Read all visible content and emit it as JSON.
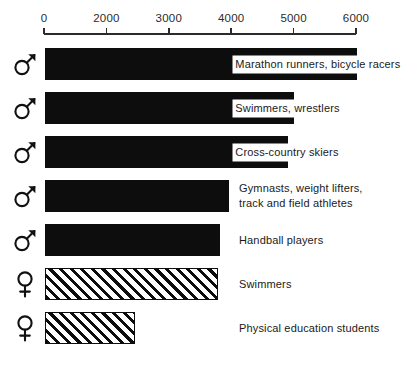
{
  "chart_data": {
    "type": "bar",
    "orientation": "horizontal",
    "title": "",
    "xlabel": "",
    "ylabel": "",
    "grid": false,
    "legend": "none",
    "axis_note": "Broken/compressed axis: 0 and 2000 are adjacent ticks with the same spacing as all later 1000-unit steps.",
    "axis_ticks": [
      {
        "label": "0",
        "value": 0,
        "pos_pct": 0
      },
      {
        "label": "2000",
        "value": 2000,
        "pos_pct": 20
      },
      {
        "label": "3000",
        "value": 3000,
        "pos_pct": 40
      },
      {
        "label": "4000",
        "value": 4000,
        "pos_pct": 60
      },
      {
        "label": "5000",
        "value": 5000,
        "pos_pct": 80
      },
      {
        "label": "6000",
        "value": 6000,
        "pos_pct": 100
      }
    ],
    "xlim": [
      0,
      6000
    ],
    "categories": [
      "Marathon runners, bicycle racers",
      "Swimmers, wrestlers",
      "Cross-country skiers",
      "Gymnasts, weight lifters, track and field athletes",
      "Handball players",
      "Swimmers",
      "Physical education students"
    ],
    "values": [
      6000,
      5000,
      4900,
      3950,
      3850,
      3800,
      2500
    ],
    "series": [
      {
        "name": "Male",
        "symbol": "mars",
        "fill": "solid",
        "values": [
          6000,
          5000,
          4900,
          3950,
          3850,
          null,
          null
        ]
      },
      {
        "name": "Female",
        "symbol": "venus",
        "fill": "hatched",
        "values": [
          null,
          null,
          null,
          null,
          null,
          3800,
          2500
        ]
      }
    ]
  },
  "colors": {
    "bar_fill": "#0d0d0d",
    "hatch_stroke": "#0d0d0d",
    "background": "#ffffff",
    "axis": "#2b2b2b",
    "text": "#1a1a1a"
  },
  "rows": [
    {
      "sex": "male",
      "sex_symbol_name": "mars-symbol-icon",
      "label": "Marathon runners, bicycle racers",
      "value": 6000,
      "bar_pct": 100,
      "label_pos_pct": 61,
      "label_over_bar": true,
      "fill": "solid"
    },
    {
      "sex": "male",
      "sex_symbol_name": "mars-symbol-icon",
      "label": "Swimmers, wrestlers",
      "value": 5000,
      "bar_pct": 79.8,
      "label_pos_pct": 61,
      "label_over_bar": true,
      "fill": "solid"
    },
    {
      "sex": "male",
      "sex_symbol_name": "mars-symbol-icon",
      "label": "Cross-country skiers",
      "value": 4900,
      "bar_pct": 78,
      "label_pos_pct": 61,
      "label_over_bar": true,
      "fill": "solid"
    },
    {
      "sex": "male",
      "sex_symbol_name": "mars-symbol-icon",
      "label": "Gymnasts, weight lifters,\ntrack and field athletes",
      "value": 3950,
      "bar_pct": 59,
      "label_pos_pct": 62.5,
      "label_over_bar": false,
      "fill": "solid"
    },
    {
      "sex": "male",
      "sex_symbol_name": "mars-symbol-icon",
      "label": "Handball players",
      "value": 3850,
      "bar_pct": 56,
      "label_pos_pct": 62.5,
      "label_over_bar": false,
      "fill": "solid"
    },
    {
      "sex": "female",
      "sex_symbol_name": "venus-symbol-icon",
      "label": "Swimmers",
      "value": 3800,
      "bar_pct": 55.5,
      "label_pos_pct": 62.5,
      "label_over_bar": false,
      "fill": "hatched"
    },
    {
      "sex": "female",
      "sex_symbol_name": "venus-symbol-icon",
      "label": "Physical education students",
      "value": 2500,
      "bar_pct": 29,
      "label_pos_pct": 62.5,
      "label_over_bar": false,
      "fill": "hatched"
    }
  ]
}
